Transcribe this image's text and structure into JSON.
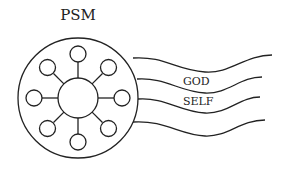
{
  "title": "PSM",
  "labels": {
    "upper": "GOD",
    "lower": "SELF"
  },
  "diagram": {
    "outer_circle": {
      "cx": 78,
      "cy": 98,
      "r": 60
    },
    "hub_circle": {
      "cx": 78,
      "cy": 98,
      "r": 20
    },
    "satellite_count": 8,
    "wave_line_count": 4,
    "stroke_color": "#222222"
  }
}
